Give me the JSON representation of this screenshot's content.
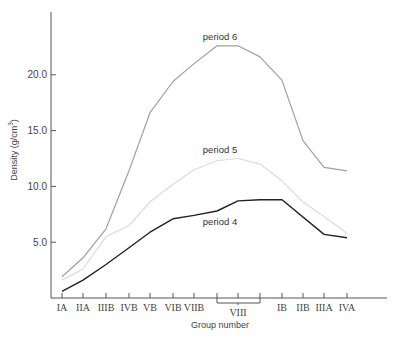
{
  "chart_data": {
    "type": "line",
    "title": "",
    "xlabel": "Group number",
    "ylabel": "Density (g/cm³)",
    "ylabel_parts": {
      "main": "Density (g/cm",
      "sup": "3",
      "end": ")"
    },
    "ylim": [
      0,
      25
    ],
    "yticks": [
      5.0,
      10.0,
      15.0,
      20.0
    ],
    "ytick_labels": [
      "5.0",
      "10.0",
      "15.0",
      "20.0"
    ],
    "grid": false,
    "legend": "inline labels",
    "categories": [
      "IA",
      "IIA",
      "IIIB",
      "IVB",
      "VB",
      "VIB",
      "VIIB",
      "VIII-1",
      "VIII-2",
      "VIII-3",
      "IB",
      "IIB",
      "IIIA",
      "IVA"
    ],
    "category_labels": [
      "IA",
      "IIA",
      "IIIB",
      "IVB",
      "VB",
      "VIB",
      "VIIB",
      "",
      "VIII",
      "",
      "IB",
      "IIB",
      "IIIA",
      "IVA"
    ],
    "group_bracket": {
      "label": "VIII",
      "from": "VIII-1",
      "to": "VIII-3"
    },
    "series": [
      {
        "name": "period 6",
        "color": "#a0a0a0",
        "values": [
          1.9,
          3.6,
          6.2,
          11.4,
          16.6,
          19.4,
          21.0,
          22.6,
          22.6,
          21.6,
          19.5,
          14.1,
          11.7,
          11.4
        ]
      },
      {
        "name": "period 5",
        "color": "#dcdcdc",
        "values": [
          1.6,
          2.6,
          5.5,
          6.5,
          8.6,
          10.2,
          11.5,
          12.3,
          12.5,
          12.0,
          10.5,
          8.6,
          7.3,
          5.8
        ]
      },
      {
        "name": "period 4",
        "color": "#222222",
        "values": [
          0.6,
          1.6,
          3.0,
          4.5,
          5.9,
          7.1,
          7.4,
          7.8,
          8.7,
          8.8,
          8.8,
          null,
          5.7,
          5.4
        ]
      }
    ],
    "annotations": [
      {
        "text": "period 6",
        "series": "period 6"
      },
      {
        "text": "period 5",
        "series": "period 5"
      },
      {
        "text": "period 4",
        "series": "period 4"
      }
    ]
  }
}
